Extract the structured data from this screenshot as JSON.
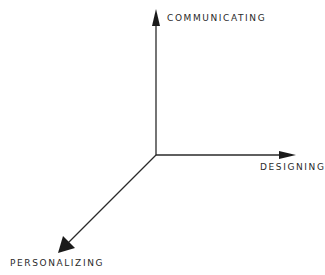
{
  "diagram": {
    "type": "3d-axes",
    "axes": [
      {
        "id": "vertical",
        "label": "COMMUNICATING",
        "direction": "up"
      },
      {
        "id": "horizontal",
        "label": "DESIGNING",
        "direction": "right"
      },
      {
        "id": "depth",
        "label": "PERSONALIZING",
        "direction": "down-left"
      }
    ],
    "colors": {
      "line": "#2a2a2a",
      "background": "#ffffff"
    }
  }
}
